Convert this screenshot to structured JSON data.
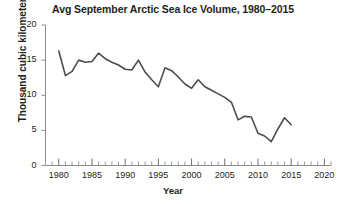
{
  "chart_data": {
    "type": "line",
    "title": "Avg September Arctic Sea Ice Volume, 1980–2015",
    "xlabel": "Year",
    "ylabel": "Thousand cubic kilometers",
    "xlim": [
      1978,
      2021
    ],
    "ylim": [
      0,
      20
    ],
    "grid": false,
    "legend": null,
    "x_major_ticks": [
      1980,
      1985,
      1990,
      1995,
      2000,
      2005,
      2010,
      2015,
      2020
    ],
    "x_major_tick_labels": [
      "1980",
      "1985",
      "1990",
      "1995",
      "2000",
      "2005",
      "2010",
      "2015",
      "2020"
    ],
    "x_minor_tick_interval": 1,
    "y_major_ticks": [
      0,
      5,
      10,
      15,
      20
    ],
    "y_major_tick_labels": [
      "0",
      "5",
      "10",
      "15",
      "20"
    ],
    "line_color": "#4d4d4d",
    "line_width": 1.6,
    "series": [
      {
        "name": "Avg September Arctic sea ice volume",
        "x": [
          1980,
          1981,
          1982,
          1983,
          1984,
          1985,
          1986,
          1987,
          1988,
          1989,
          1990,
          1991,
          1992,
          1993,
          1994,
          1995,
          1996,
          1997,
          1998,
          1999,
          2000,
          2001,
          2002,
          2003,
          2004,
          2005,
          2006,
          2007,
          2008,
          2009,
          2010,
          2011,
          2012,
          2013,
          2014,
          2015
        ],
        "values": [
          16.3,
          12.8,
          13.4,
          15.0,
          14.7,
          14.8,
          16.0,
          15.2,
          14.7,
          14.3,
          13.7,
          13.6,
          15.0,
          13.3,
          12.2,
          11.2,
          13.9,
          13.5,
          12.6,
          11.6,
          11.0,
          12.2,
          11.2,
          10.7,
          10.2,
          9.7,
          9.0,
          6.5,
          7.0,
          6.9,
          4.6,
          4.2,
          3.4,
          5.2,
          6.8,
          5.8
        ]
      }
    ]
  }
}
